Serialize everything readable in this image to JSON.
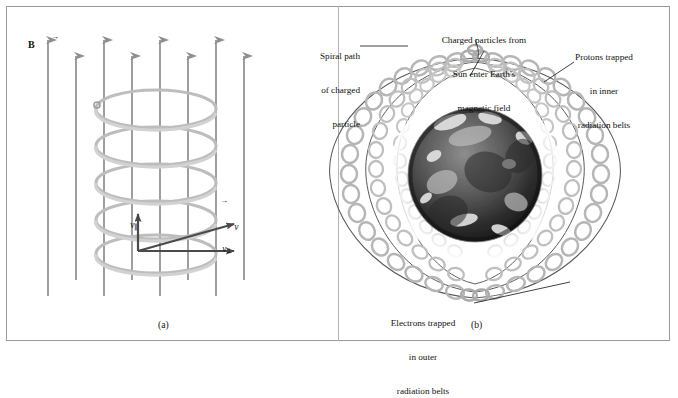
{
  "figure": {
    "background": "#ffffff",
    "border_color": "#9a9a9a",
    "field_line_color": "#8e8e8e",
    "helix_color": "#b9b9b9",
    "vector_color": "#4a4a4a",
    "leader_color": "#2b2b2b"
  },
  "panel_a": {
    "caption": "(a)",
    "field_label": "B",
    "field_line_count": 9,
    "velocity": {
      "resultant_label": "v",
      "parallel_label": "v",
      "parallel_sub": "∥",
      "perp_label": "v",
      "perp_sub": "⊥"
    }
  },
  "panel_b": {
    "caption": "(b)",
    "annotations": [
      {
        "name": "spiral-path",
        "lines": [
          "Spiral path",
          "of charged",
          "particle"
        ],
        "align": "right"
      },
      {
        "name": "charged-particles-from-sun",
        "lines": [
          "Charged particles from",
          "Sun enter Earth's",
          "magnetic field"
        ],
        "align": "center"
      },
      {
        "name": "protons-inner-belts",
        "lines": [
          "Protons trapped",
          "in inner",
          "radiation belts"
        ],
        "align": "center"
      },
      {
        "name": "electrons-outer-belts",
        "lines": [
          "Electrons trapped",
          "in outer",
          "radiation belts"
        ],
        "align": "center"
      }
    ]
  }
}
